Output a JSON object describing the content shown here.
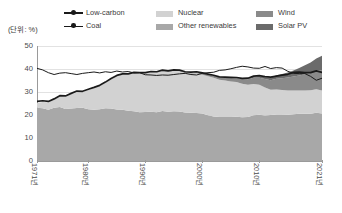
{
  "unit_label": "(단위: %)",
  "legend": {
    "lines": [
      {
        "name": "low-carbon",
        "label": "Low-carbon",
        "color": "#1a1a1a",
        "weight": "thick"
      },
      {
        "name": "coal",
        "label": "Coal",
        "color": "#1a1a1a",
        "weight": "thin"
      }
    ],
    "areas": [
      {
        "name": "nuclear",
        "label": "Nuclear",
        "color": "#d2d2d2"
      },
      {
        "name": "other-renewables",
        "label": "Other renewables",
        "color": "#a8a8a8"
      },
      {
        "name": "wind",
        "label": "Wind",
        "color": "#8a8a8a"
      },
      {
        "name": "solar-pv",
        "label": "Solar PV",
        "color": "#6b6b6b"
      }
    ]
  },
  "chart_data": {
    "type": "area",
    "title": "",
    "subtitle": "",
    "xlabel": "",
    "ylabel": "",
    "unit": "%",
    "grid": true,
    "legend_position": "top",
    "xlim": [
      1971,
      2021
    ],
    "ylim": [
      0,
      50
    ],
    "yticks": [
      0,
      10,
      20,
      30,
      40,
      50
    ],
    "ytick_labels": [
      "0",
      "10",
      "20",
      "30",
      "40",
      "50"
    ],
    "xticks": [
      1971,
      1980,
      1990,
      2000,
      2010,
      2021
    ],
    "xtick_labels": [
      "1971년",
      "1980년",
      "1990년",
      "2000년",
      "2010년",
      "2021년"
    ],
    "x": [
      1971,
      1972,
      1973,
      1974,
      1975,
      1976,
      1977,
      1978,
      1979,
      1980,
      1981,
      1982,
      1983,
      1984,
      1985,
      1986,
      1987,
      1988,
      1989,
      1990,
      1991,
      1992,
      1993,
      1994,
      1995,
      1996,
      1997,
      1998,
      1999,
      2000,
      2001,
      2002,
      2003,
      2004,
      2005,
      2006,
      2007,
      2008,
      2009,
      2010,
      2011,
      2012,
      2013,
      2014,
      2015,
      2016,
      2017,
      2018,
      2019,
      2020,
      2021
    ],
    "stacked_series": [
      {
        "name": "other-renewables",
        "label": "Other renewables",
        "color": "#a8a8a8",
        "values": [
          23.1,
          22.9,
          22.3,
          23.2,
          23.5,
          22.6,
          22.8,
          23.0,
          23.1,
          22.5,
          22.3,
          22.5,
          22.9,
          22.8,
          22.4,
          22.3,
          21.9,
          21.6,
          21.2,
          21.3,
          21.4,
          21.2,
          21.7,
          21.4,
          21.6,
          21.5,
          21.1,
          21.0,
          20.9,
          20.7,
          19.9,
          19.4,
          19.1,
          19.1,
          19.1,
          19.2,
          19.0,
          19.1,
          19.9,
          20.1,
          19.8,
          20.0,
          20.2,
          20.2,
          20.1,
          20.3,
          20.5,
          20.5,
          20.5,
          21.0,
          20.7
        ]
      },
      {
        "name": "nuclear",
        "label": "Nuclear",
        "color": "#d2d2d2",
        "values": [
          2.1,
          2.8,
          3.2,
          3.4,
          4.5,
          5.2,
          6.2,
          7.0,
          6.8,
          8.4,
          9.4,
          10.1,
          11.1,
          12.8,
          14.5,
          15.3,
          15.8,
          16.6,
          16.9,
          16.9,
          17.2,
          17.3,
          17.3,
          17.4,
          17.5,
          17.6,
          17.2,
          17.0,
          17.2,
          16.8,
          17.0,
          16.8,
          16.2,
          15.9,
          15.5,
          15.1,
          14.6,
          14.1,
          13.6,
          13.0,
          12.2,
          11.0,
          10.9,
          10.7,
          10.6,
          10.4,
          10.2,
          10.2,
          10.3,
          10.2,
          9.9
        ]
      },
      {
        "name": "wind",
        "label": "Wind",
        "color": "#8a8a8a",
        "values": [
          0,
          0,
          0,
          0,
          0,
          0,
          0,
          0,
          0,
          0,
          0,
          0,
          0,
          0,
          0.02,
          0.03,
          0.04,
          0.05,
          0.06,
          0.08,
          0.1,
          0.12,
          0.15,
          0.18,
          0.22,
          0.25,
          0.3,
          0.38,
          0.48,
          0.6,
          0.73,
          0.9,
          1.05,
          1.25,
          1.45,
          1.7,
          2.0,
          2.3,
          2.75,
          3.1,
          3.6,
          4.1,
          4.7,
          5.1,
          5.6,
          6.0,
          6.5,
          7.0,
          7.5,
          8.2,
          9.0
        ]
      },
      {
        "name": "solar-pv",
        "label": "Solar PV",
        "color": "#6b6b6b",
        "values": [
          0,
          0,
          0,
          0,
          0,
          0,
          0,
          0,
          0,
          0,
          0,
          0,
          0,
          0,
          0,
          0,
          0,
          0,
          0,
          0,
          0,
          0,
          0,
          0,
          0,
          0.01,
          0.01,
          0.01,
          0.02,
          0.02,
          0.03,
          0.04,
          0.05,
          0.07,
          0.1,
          0.14,
          0.2,
          0.3,
          0.45,
          0.6,
          0.85,
          1.15,
          1.5,
          1.85,
          2.2,
          2.6,
          3.2,
          3.9,
          4.5,
          5.2,
          6.2
        ]
      }
    ],
    "line_series": [
      {
        "name": "coal",
        "label": "Coal",
        "color": "#1a1a1a",
        "weight": "thin",
        "values": [
          40.3,
          39.6,
          38.4,
          37.6,
          38.2,
          38.4,
          38.0,
          37.6,
          38.1,
          38.4,
          38.7,
          38.3,
          38.8,
          38.5,
          39.1,
          38.7,
          38.9,
          38.3,
          38.4,
          37.5,
          37.4,
          37.2,
          37.4,
          37.3,
          37.6,
          37.9,
          38.1,
          37.6,
          37.4,
          38.1,
          38.4,
          38.6,
          39.4,
          39.6,
          40.1,
          40.7,
          41.2,
          40.9,
          40.4,
          40.3,
          41.1,
          40.2,
          40.6,
          40.4,
          39.0,
          38.1,
          38.0,
          38.0,
          36.8,
          35.1,
          36.0
        ]
      },
      {
        "name": "low-carbon",
        "label": "Low-carbon",
        "color": "#1a1a1a",
        "weight": "thick",
        "values": [
          25.9,
          26.2,
          25.9,
          27.0,
          28.4,
          28.3,
          29.4,
          30.4,
          30.3,
          31.2,
          32.0,
          32.9,
          34.3,
          35.9,
          37.2,
          37.9,
          37.9,
          38.5,
          38.4,
          38.4,
          38.9,
          38.8,
          39.5,
          39.2,
          39.6,
          39.5,
          38.8,
          38.6,
          38.8,
          38.3,
          37.8,
          37.3,
          36.6,
          36.5,
          36.4,
          36.3,
          35.9,
          36.0,
          36.9,
          37.1,
          36.7,
          36.5,
          36.9,
          37.3,
          37.7,
          38.5,
          38.7,
          38.4,
          38.4,
          39.2,
          38.5
        ]
      }
    ]
  }
}
